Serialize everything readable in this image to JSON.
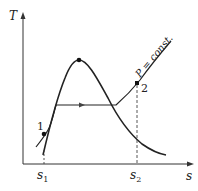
{
  "diagram": {
    "type": "T-s diagram",
    "axes": {
      "y_label": "T",
      "x_label": "s"
    },
    "ticks": {
      "s1_main": "s",
      "s1_sub": "1",
      "s2_main": "s",
      "s2_sub": "2"
    },
    "points": {
      "p1": "1",
      "p2": "2"
    },
    "isobar_label": "P = const."
  }
}
